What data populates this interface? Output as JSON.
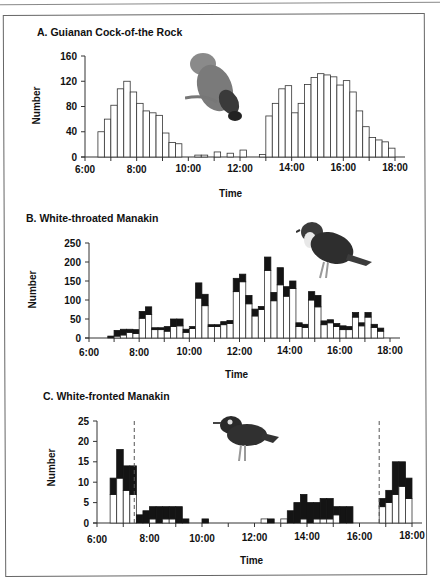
{
  "chart_data": [
    {
      "type": "bar",
      "title": "A. Guianan Cock-of-the Rock",
      "xlabel": "Time",
      "ylabel": "Number",
      "ylim": [
        0,
        160
      ],
      "yticks": [
        0,
        40,
        80,
        120,
        160
      ],
      "xticks": [
        "6:00",
        "8:00",
        "10:00",
        "12:00",
        "14:00",
        "16:00",
        "18:00"
      ],
      "bin_minutes": 15,
      "x_start": "6:00",
      "series": [
        {
          "name": "Number",
          "style": "open",
          "values": [
            0,
            0,
            40,
            60,
            82,
            108,
            120,
            103,
            85,
            73,
            70,
            66,
            38,
            23,
            21,
            0,
            0,
            3,
            3,
            0,
            8,
            0,
            6,
            0,
            11,
            0,
            0,
            4,
            65,
            85,
            108,
            113,
            70,
            85,
            115,
            126,
            132,
            130,
            127,
            114,
            121,
            103,
            73,
            48,
            31,
            27,
            24,
            14
          ]
        }
      ],
      "grid": false,
      "legend": null
    },
    {
      "type": "bar",
      "stacked": true,
      "title": "B. White-throated Manakin",
      "xlabel": "Time",
      "ylabel": "Number",
      "ylim": [
        0,
        250
      ],
      "yticks": [
        0,
        50,
        100,
        150,
        200,
        250
      ],
      "xticks": [
        "6:00",
        "8:00",
        "10:00",
        "12:00",
        "14:00",
        "16:00",
        "18:00"
      ],
      "bin_minutes": 15,
      "x_start": "6:00",
      "series": [
        {
          "name": "open (white)",
          "values": [
            0,
            0,
            0,
            2,
            5,
            8,
            15,
            12,
            52,
            62,
            22,
            22,
            18,
            30,
            32,
            15,
            25,
            105,
            85,
            30,
            30,
            35,
            38,
            122,
            148,
            90,
            58,
            75,
            178,
            98,
            140,
            110,
            130,
            30,
            28,
            100,
            82,
            35,
            40,
            30,
            22,
            22,
            55,
            32,
            55,
            28,
            18,
            0
          ]
        },
        {
          "name": "filled (black)",
          "values": [
            0,
            0,
            0,
            3,
            15,
            15,
            8,
            10,
            18,
            20,
            5,
            5,
            12,
            20,
            18,
            8,
            5,
            40,
            30,
            5,
            5,
            8,
            8,
            35,
            20,
            22,
            18,
            8,
            35,
            22,
            45,
            25,
            20,
            10,
            8,
            22,
            30,
            10,
            8,
            8,
            10,
            8,
            12,
            8,
            12,
            8,
            8,
            0
          ]
        }
      ],
      "grid": false,
      "legend": null
    },
    {
      "type": "bar",
      "stacked": true,
      "title": "C. White-fronted Manakin",
      "xlabel": "Time",
      "ylabel": "Number",
      "ylim": [
        0,
        25
      ],
      "yticks": [
        0,
        5,
        10,
        15,
        20,
        25
      ],
      "xticks": [
        "6:00",
        "8:00",
        "10:00",
        "12:00",
        "14:00",
        "16:00",
        "18:00"
      ],
      "bin_minutes": 15,
      "x_start": "6:00",
      "annotations": [
        "dashed vertical line ~7:25",
        "dashed vertical line ~16:45"
      ],
      "series": [
        {
          "name": "open (white)",
          "values": [
            0,
            0,
            7,
            11,
            8,
            7,
            0,
            0,
            1,
            0,
            1,
            1,
            0,
            0,
            0,
            0,
            0,
            0,
            0,
            0,
            0,
            0,
            0,
            0,
            0,
            1,
            0,
            0,
            1,
            0,
            0,
            1,
            0,
            1,
            1,
            1,
            2,
            0,
            0,
            0,
            0,
            0,
            0,
            4,
            5,
            7,
            9,
            6
          ]
        },
        {
          "name": "filled (black)",
          "values": [
            0,
            0,
            4,
            7,
            6,
            7,
            2,
            3,
            3,
            4,
            3,
            3,
            4,
            1,
            0,
            0,
            1,
            0,
            0,
            0,
            0,
            0,
            0,
            0,
            0,
            0,
            1,
            0,
            0,
            3,
            5,
            6,
            5,
            4,
            5,
            5,
            2,
            4,
            4,
            0,
            0,
            0,
            0,
            2,
            3,
            8,
            6,
            5
          ]
        }
      ],
      "grid": false,
      "legend": null
    }
  ],
  "panels": {
    "a": {
      "title": "A. Guianan Cock-of-the Rock",
      "ylabel": "Number",
      "xlabel": "Time",
      "bird": "cock-of-the-rock-illustration"
    },
    "b": {
      "title": "B. White-throated Manakin",
      "ylabel": "Number",
      "xlabel": "Time",
      "bird": "white-throated-manakin-illustration"
    },
    "c": {
      "title": "C. White-fronted Manakin",
      "ylabel": "Number",
      "xlabel": "Time",
      "bird": "white-fronted-manakin-illustration"
    }
  },
  "colors": {
    "bar_open": "#ffffff",
    "bar_filled": "#141414",
    "axis": "#333333"
  }
}
